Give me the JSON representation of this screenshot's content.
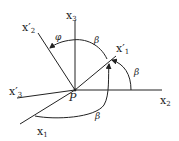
{
  "diagram": {
    "type": "rotation-of-coordinate-axes",
    "origin_label": "P",
    "axes": {
      "x1": {
        "label": "x",
        "sub": "1"
      },
      "x2": {
        "label": "x",
        "sub": "2"
      },
      "x3": {
        "label": "x",
        "sub": "3"
      },
      "x1p": {
        "label": "x′",
        "sub": "1"
      },
      "x2p": {
        "label": "x′",
        "sub": "2"
      },
      "x3p": {
        "label": "x′",
        "sub": "3"
      }
    },
    "angles": {
      "phi": "φ",
      "beta_top": "β",
      "beta_right": "β",
      "beta_bottom": "β"
    },
    "colors": {
      "ink": "#222222",
      "background": "#ffffff"
    }
  }
}
